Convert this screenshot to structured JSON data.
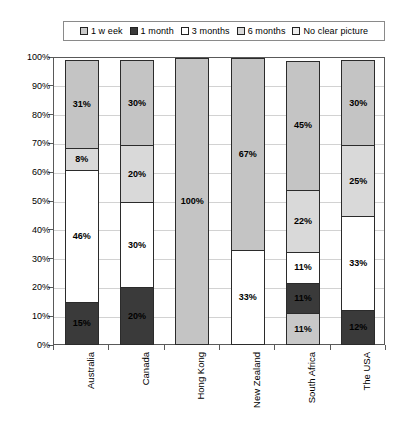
{
  "chart_data": {
    "type": "bar",
    "subtype": "stacked-percent",
    "title": "",
    "subtitle": "",
    "xlabel": "",
    "ylabel": "",
    "ylim": [
      0,
      100
    ],
    "ytick_labels": [
      "0%",
      "10%",
      "20%",
      "30%",
      "40%",
      "50%",
      "60%",
      "70%",
      "80%",
      "90%",
      "100%"
    ],
    "ytick_values": [
      0,
      10,
      20,
      30,
      40,
      50,
      60,
      70,
      80,
      90,
      100
    ],
    "grid": true,
    "legend_position": "top",
    "categories": [
      "Australia",
      "Canada",
      "Hong Kong",
      "New Zealand",
      "South Africa",
      "The USA"
    ],
    "series": [
      {
        "name": "1 w eek",
        "color": "#c8c8c8",
        "values": [
          0,
          0,
          0,
          0,
          11,
          0
        ],
        "labels": [
          "",
          "",
          "",
          "",
          "11%",
          ""
        ]
      },
      {
        "name": "1 month",
        "color": "#3a3a3a",
        "values": [
          15,
          20,
          0,
          0,
          11,
          12
        ],
        "labels": [
          "15%",
          "20%",
          "",
          "",
          "11%",
          "12%"
        ]
      },
      {
        "name": "3 months",
        "color": "#ffffff",
        "values": [
          46,
          30,
          0,
          33,
          11,
          33
        ],
        "labels": [
          "46%",
          "30%",
          "",
          "33%",
          "11%",
          "33%"
        ]
      },
      {
        "name": "6 months",
        "color": "#d9d9d9",
        "values": [
          8,
          20,
          0,
          0,
          22,
          25
        ],
        "labels": [
          "8%",
          "20%",
          "",
          "",
          "22%",
          "25%"
        ]
      },
      {
        "name": "No clear picture",
        "color": "#c4c4c4",
        "values": [
          31,
          30,
          100,
          67,
          45,
          30
        ],
        "labels": [
          "31%",
          "30%",
          "100%",
          "67%",
          "45%",
          "30%"
        ]
      }
    ]
  },
  "legend": {
    "items": [
      {
        "label": "1 w eek",
        "color": "#c8c8c8"
      },
      {
        "label": "1 month",
        "color": "#3a3a3a"
      },
      {
        "label": "3 months",
        "color": "#ffffff"
      },
      {
        "label": "6 months",
        "color": "#d9d9d9"
      },
      {
        "label": "No clear picture",
        "color": "#ededed"
      }
    ]
  }
}
